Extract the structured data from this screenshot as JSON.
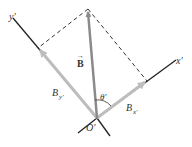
{
  "diagram": {
    "labels": {
      "y_axis": "y′",
      "x_axis": "x′",
      "vector": "B",
      "vector_arrow": "→",
      "component_y": "B",
      "component_y_sub": "y′",
      "component_x": "B",
      "component_x_sub": "x′",
      "angle": "θ′",
      "origin": "O′"
    },
    "colors": {
      "axis": "#222222",
      "vector": "#8a8a8a",
      "components": "#bdbdbd",
      "dashed": "#333333"
    }
  }
}
